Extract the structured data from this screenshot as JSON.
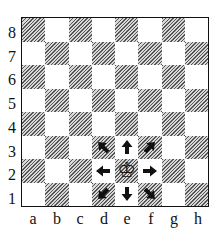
{
  "diagram": {
    "ranks": [
      "8",
      "7",
      "6",
      "5",
      "4",
      "3",
      "2",
      "1"
    ],
    "files": [
      "a",
      "b",
      "c",
      "d",
      "e",
      "f",
      "g",
      "h"
    ],
    "piece": {
      "type": "king",
      "color": "white",
      "square": "e2",
      "glyph": "♔"
    },
    "move_arrows": [
      {
        "square": "d3",
        "direction": "up-left"
      },
      {
        "square": "e3",
        "direction": "up"
      },
      {
        "square": "f3",
        "direction": "up-right"
      },
      {
        "square": "d2",
        "direction": "left"
      },
      {
        "square": "f2",
        "direction": "right"
      },
      {
        "square": "d1",
        "direction": "down-left"
      },
      {
        "square": "e1",
        "direction": "down"
      },
      {
        "square": "f1",
        "direction": "down-right"
      }
    ]
  }
}
